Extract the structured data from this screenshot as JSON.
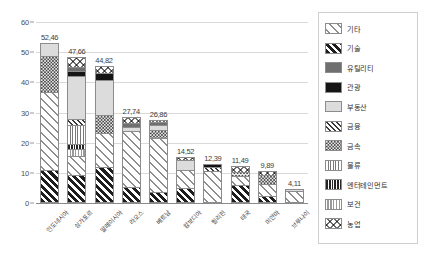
{
  "chart_data": {
    "type": "bar",
    "subtype": "stacked-bar",
    "title": "",
    "xlabel": "",
    "ylabel": "",
    "ylim": [
      0,
      60
    ],
    "ytick_values": [
      0,
      10,
      20,
      30,
      40,
      50,
      60
    ],
    "ytick_labels": [
      "0",
      "10",
      "20",
      "30",
      "40",
      "50",
      "60"
    ],
    "grid": true,
    "legend_position": "right",
    "decimal_separator": ",",
    "categories": [
      "인도네시아",
      "싱가포르",
      "말레이시아",
      "라오스",
      "베트남",
      "캄보디아",
      "필리핀",
      "태국",
      "미얀마",
      "브루나이"
    ],
    "totals": [
      52.46,
      47.66,
      44.82,
      27.74,
      26.86,
      14.52,
      12.39,
      11.49,
      9.89,
      4.11
    ],
    "total_labels": [
      "52,46",
      "47,66",
      "44,82",
      "27,74",
      "26,86",
      "14,52",
      "12,39",
      "11,49",
      "9,89",
      "4,11"
    ],
    "series": [
      {
        "name": "기술",
        "pattern": "p-gisul",
        "values": [
          10.2,
          8.6,
          11.4,
          4.6,
          3.1,
          4.2,
          0.0,
          5.2,
          1.6,
          0.0
        ]
      },
      {
        "name": "기타",
        "pattern": "p-gita",
        "values": [
          25.9,
          6.4,
          11.2,
          18.6,
          17.9,
          6.1,
          9.8,
          3.0,
          4.0,
          3.2
        ]
      },
      {
        "name": "보건",
        "pattern": "p-bogeon",
        "values": [
          0.0,
          2.3,
          0.0,
          0.0,
          0.0,
          0.0,
          0.0,
          0.0,
          0.0,
          0.0
        ]
      },
      {
        "name": "엔터테인먼트",
        "pattern": "p-enter",
        "values": [
          0.0,
          1.6,
          0.0,
          0.0,
          0.0,
          0.0,
          0.0,
          0.0,
          0.0,
          0.0
        ]
      },
      {
        "name": "물류",
        "pattern": "p-mulryu",
        "values": [
          0.0,
          6.2,
          0.0,
          0.0,
          0.0,
          0.0,
          0.0,
          0.0,
          0.0,
          0.0
        ]
      },
      {
        "name": "금속",
        "pattern": "p-geumsok",
        "values": [
          11.9,
          0.0,
          5.8,
          0.0,
          2.6,
          0.0,
          0.0,
          1.4,
          3.0,
          0.0
        ]
      },
      {
        "name": "금융",
        "pattern": "p-geumyung",
        "values": [
          0.0,
          2.2,
          0.0,
          0.0,
          0.0,
          0.0,
          1.5,
          0.0,
          0.0,
          0.0
        ]
      },
      {
        "name": "부동산",
        "pattern": "p-budongsan",
        "values": [
          4.5,
          14.1,
          11.6,
          1.4,
          1.7,
          3.2,
          0.0,
          0.0,
          0.0,
          0.9
        ]
      },
      {
        "name": "관광",
        "pattern": "p-gwangwang",
        "values": [
          0.0,
          1.6,
          2.3,
          0.0,
          0.0,
          0.0,
          1.1,
          0.0,
          0.0,
          0.0
        ]
      },
      {
        "name": "유틸리티",
        "pattern": "p-util",
        "values": [
          0.0,
          1.4,
          0.0,
          1.3,
          0.9,
          0.0,
          0.0,
          0.0,
          0.0,
          0.0
        ]
      },
      {
        "name": "농업",
        "pattern": "p-nongup",
        "values": [
          0.0,
          3.3,
          2.5,
          1.8,
          0.7,
          1.0,
          0.0,
          1.9,
          1.3,
          0.0
        ]
      }
    ]
  },
  "legend": {
    "items": [
      {
        "label": "기타",
        "pattern": "p-gita"
      },
      {
        "label": "기술",
        "pattern": "p-gisul"
      },
      {
        "label": "유틸리티",
        "pattern": "p-util"
      },
      {
        "label": "관광",
        "pattern": "p-gwangwang"
      },
      {
        "label": "부동산",
        "pattern": "p-budongsan"
      },
      {
        "label": "금융",
        "pattern": "p-geumyung"
      },
      {
        "label": "금속",
        "pattern": "p-geumsok"
      },
      {
        "label": "물류",
        "pattern": "p-mulryu"
      },
      {
        "label": "엔터테인먼트",
        "pattern": "p-enter"
      },
      {
        "label": "보건",
        "pattern": "p-bogeon"
      },
      {
        "label": "농업",
        "pattern": "p-nongup"
      }
    ]
  },
  "colors": {
    "grid": "#d9d9d9",
    "axis": "#8a8a8a",
    "text": "#3d3d3d",
    "legend_border": "#cfcfcf"
  }
}
